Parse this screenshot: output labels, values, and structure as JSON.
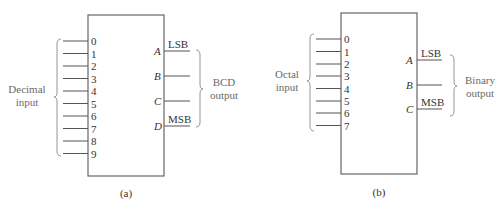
{
  "diagrams": [
    {
      "id": "a",
      "caption": "(a)",
      "input_group_label_line1": "Decimal",
      "input_group_label_line2": "input",
      "inputs": [
        "0",
        "1",
        "2",
        "3",
        "4",
        "5",
        "6",
        "7",
        "8",
        "9"
      ],
      "outputs": [
        {
          "name": "A",
          "tag": "LSB"
        },
        {
          "name": "B",
          "tag": ""
        },
        {
          "name": "C",
          "tag": ""
        },
        {
          "name": "D",
          "tag": "MSB"
        }
      ],
      "output_group_label_line1": "BCD",
      "output_group_label_line2": "output"
    },
    {
      "id": "b",
      "caption": "(b)",
      "input_group_label_line1": "Octal",
      "input_group_label_line2": "input",
      "inputs": [
        "0",
        "1",
        "2",
        "3",
        "4",
        "5",
        "6",
        "7"
      ],
      "outputs": [
        {
          "name": "A",
          "tag": "LSB"
        },
        {
          "name": "B",
          "tag": ""
        },
        {
          "name": "C",
          "tag": "MSB"
        }
      ],
      "output_group_label_line1": "Binary",
      "output_group_label_line2": "output"
    }
  ],
  "colors": {
    "line": "#555555",
    "text": "#333333",
    "group_label": "#6a6a6a"
  }
}
